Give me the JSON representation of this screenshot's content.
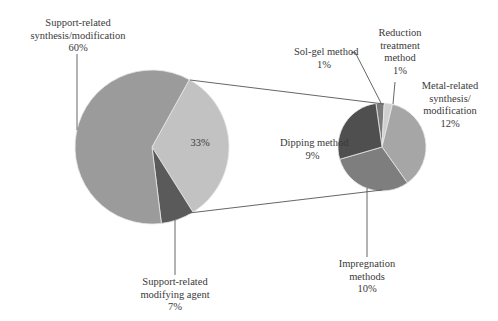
{
  "chart_data": {
    "type": "pie",
    "subtype": "pie-of-pie",
    "title": "",
    "main_pie": {
      "slices": [
        {
          "label": "Support-related synthesis/modification",
          "value": 60,
          "color": "#9b9b9b"
        },
        {
          "label": "Other (expanded)",
          "value": 33,
          "color": "#c2c2c2",
          "inner_label": "33%"
        },
        {
          "label": "Support-related modifying agent",
          "value": 7,
          "color": "#5a5a5a"
        }
      ]
    },
    "secondary_pie": {
      "total": 33,
      "slices": [
        {
          "label": "Sol-gel method",
          "value": 1,
          "color": "#7a7a7a"
        },
        {
          "label": "Reduction treatment method",
          "value": 1,
          "color": "#cfcfcf"
        },
        {
          "label": "Metal-related synthesis/modification",
          "value": 12,
          "color": "#a6a6a6"
        },
        {
          "label": "Impregnation methods",
          "value": 10,
          "color": "#7e7e7e"
        },
        {
          "label": "Dipping method",
          "value": 9,
          "color": "#4f4f4f"
        }
      ]
    }
  },
  "labels": {
    "support_synth": {
      "line1": "Support-related",
      "line2": "synthesis/modification",
      "pct": "60%"
    },
    "other_pct": "33%",
    "support_agent": {
      "line1": "Support-related",
      "line2": "modifying agent",
      "pct": "7%"
    },
    "solgel": {
      "line1": "Sol-gel method",
      "pct": "1%"
    },
    "reduction": {
      "line1": "Reduction",
      "line2": "treatment",
      "line3": "method",
      "pct": "1%"
    },
    "metal": {
      "line1": "Metal-related",
      "line2": "synthesis/",
      "line3": "modification",
      "pct": "12%"
    },
    "dipping": {
      "line1": "Dipping method",
      "pct": "9%"
    },
    "impregnation": {
      "line1": "Impregnation",
      "line2": "methods",
      "pct": "10%"
    }
  }
}
